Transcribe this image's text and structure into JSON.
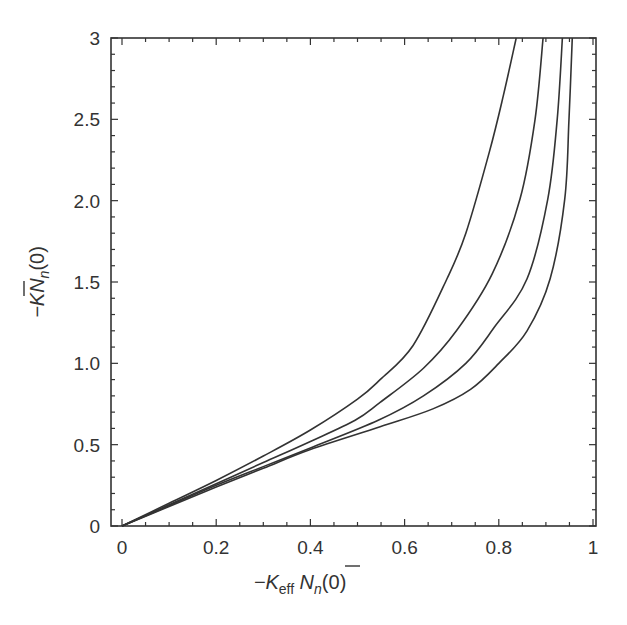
{
  "chart_data": {
    "type": "line",
    "title": "",
    "xlabel": "−K_eff N̄_n(0)",
    "ylabel": "−K N̄_n(0)",
    "xlabel_parts": {
      "prefix": "−K",
      "sub": "eff",
      "main": " N",
      "main_sub": "n",
      "suffix": "(0)"
    },
    "ylabel_parts": {
      "prefix": "−K",
      "main": "N",
      "main_sub": "n",
      "suffix": "(0)"
    },
    "xlim": [
      0,
      1
    ],
    "ylim": [
      0,
      3
    ],
    "x_ticks": [
      0,
      0.2,
      0.4,
      0.6,
      0.8,
      1
    ],
    "x_tick_labels": [
      "0",
      "0.2",
      "0.4",
      "0.6",
      "0.8",
      "1"
    ],
    "y_ticks": [
      0,
      0.5,
      1.0,
      1.5,
      2.0,
      2.5,
      3
    ],
    "y_tick_labels": [
      "0",
      "0.5",
      "1.0",
      "1.5",
      "2.0",
      "2.5",
      "3"
    ],
    "grid": false,
    "legend": null,
    "series": [
      {
        "name": "curve-1",
        "color": "#333333",
        "x": [
          0,
          0.1,
          0.2,
          0.3,
          0.4,
          0.5,
          0.548,
          0.618,
          0.69,
          0.73,
          0.78,
          0.81,
          0.837
        ],
        "y": [
          0,
          0.14,
          0.28,
          0.43,
          0.59,
          0.78,
          0.9,
          1.11,
          1.52,
          1.8,
          2.3,
          2.65,
          3.0
        ]
      },
      {
        "name": "curve-2",
        "color": "#333333",
        "x": [
          0,
          0.1,
          0.2,
          0.3,
          0.4,
          0.495,
          0.548,
          0.64,
          0.71,
          0.786,
          0.845,
          0.877,
          0.894
        ],
        "y": [
          0,
          0.13,
          0.26,
          0.39,
          0.52,
          0.65,
          0.76,
          0.97,
          1.2,
          1.55,
          2.01,
          2.5,
          3.0
        ]
      },
      {
        "name": "curve-3",
        "color": "#333333",
        "x": [
          0,
          0.1,
          0.2,
          0.3,
          0.4,
          0.544,
          0.64,
          0.73,
          0.79,
          0.86,
          0.904,
          0.924,
          0.935
        ],
        "y": [
          0,
          0.125,
          0.25,
          0.365,
          0.48,
          0.65,
          0.8,
          1.0,
          1.22,
          1.52,
          2.01,
          2.5,
          3.0
        ]
      },
      {
        "name": "curve-4",
        "color": "#333333",
        "x": [
          0,
          0.1,
          0.2,
          0.3,
          0.4,
          0.548,
          0.66,
          0.74,
          0.8,
          0.86,
          0.909,
          0.94,
          0.949,
          0.956
        ],
        "y": [
          0,
          0.12,
          0.24,
          0.355,
          0.47,
          0.61,
          0.72,
          0.84,
          1.0,
          1.2,
          1.52,
          2.01,
          2.5,
          3.0
        ]
      }
    ]
  }
}
